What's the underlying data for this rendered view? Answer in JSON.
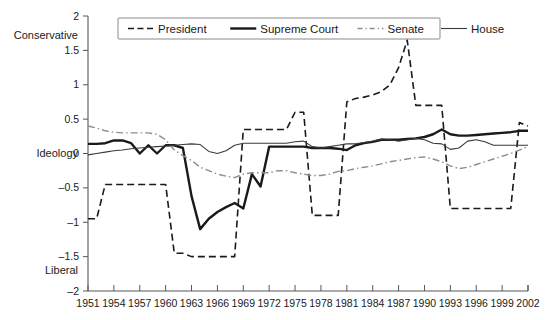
{
  "chart_data": {
    "type": "line",
    "title": "",
    "subtitle": "",
    "xlabel": "",
    "ylabel": "Ideology",
    "xlim": [
      1951,
      2002
    ],
    "ylim": [
      -2,
      2
    ],
    "grid": false,
    "legend_position": "top-inside",
    "y_axis_top_annotation": "Conservative",
    "y_axis_mid_annotation": "Ideology",
    "y_axis_bottom_annotation": "Liberal",
    "yticks": [
      2,
      1.5,
      1,
      0.5,
      0,
      -0.5,
      -1,
      -1.5,
      -2
    ],
    "ytick_labels": [
      "2",
      "1.5",
      "1",
      "0.5",
      "0",
      "-0.5",
      "-1",
      "-1.5",
      "-2"
    ],
    "xticks": [
      1951,
      1954,
      1957,
      1960,
      1963,
      1966,
      1969,
      1972,
      1975,
      1978,
      1981,
      1984,
      1987,
      1990,
      1993,
      1996,
      1999,
      2002
    ],
    "xtick_labels": [
      "1951",
      "1954",
      "1957",
      "1960",
      "1963",
      "1966",
      "1969",
      "1972",
      "1975",
      "1978",
      "1981",
      "1984",
      "1987",
      "1990",
      "1993",
      "1996",
      "1999",
      "2002"
    ],
    "x": [
      1951,
      1952,
      1953,
      1954,
      1955,
      1956,
      1957,
      1958,
      1959,
      1960,
      1961,
      1962,
      1963,
      1964,
      1965,
      1966,
      1967,
      1968,
      1969,
      1970,
      1971,
      1972,
      1973,
      1974,
      1975,
      1976,
      1977,
      1978,
      1979,
      1980,
      1981,
      1982,
      1983,
      1984,
      1985,
      1986,
      1987,
      1988,
      1989,
      1990,
      1991,
      1992,
      1993,
      1994,
      1995,
      1996,
      1997,
      1998,
      1999,
      2000,
      2001,
      2002
    ],
    "series": [
      {
        "name": "President",
        "style": "dashed",
        "color": "#1a1a1a",
        "width": 1.6,
        "values": [
          -0.95,
          -0.95,
          -0.45,
          -0.45,
          -0.45,
          -0.45,
          -0.45,
          -0.45,
          -0.45,
          -0.45,
          -1.45,
          -1.45,
          -1.5,
          -1.5,
          -1.5,
          -1.5,
          -1.5,
          -1.5,
          0.35,
          0.35,
          0.35,
          0.35,
          0.35,
          0.35,
          0.6,
          0.6,
          -0.9,
          -0.9,
          -0.9,
          -0.9,
          0.75,
          0.8,
          0.82,
          0.85,
          0.9,
          1.0,
          1.25,
          1.65,
          0.7,
          0.7,
          0.7,
          0.7,
          -0.8,
          -0.8,
          -0.8,
          -0.8,
          -0.8,
          -0.8,
          -0.8,
          -0.8,
          0.45,
          0.4
        ]
      },
      {
        "name": "Supreme Court",
        "style": "solid",
        "color": "#1a1a1a",
        "width": 2.4,
        "values": [
          0.14,
          0.14,
          0.15,
          0.19,
          0.19,
          0.15,
          0.0,
          0.12,
          0.0,
          0.12,
          0.12,
          0.08,
          -0.62,
          -1.1,
          -0.95,
          -0.85,
          -0.78,
          -0.72,
          -0.8,
          -0.3,
          -0.48,
          0.1,
          0.1,
          0.1,
          0.1,
          0.1,
          0.08,
          0.08,
          0.08,
          0.07,
          0.05,
          0.12,
          0.15,
          0.17,
          0.2,
          0.2,
          0.2,
          0.21,
          0.22,
          0.24,
          0.28,
          0.35,
          0.28,
          0.26,
          0.26,
          0.27,
          0.28,
          0.29,
          0.3,
          0.31,
          0.33,
          0.33
        ]
      },
      {
        "name": "Senate",
        "style": "dashdot",
        "color": "#8d8d8f",
        "width": 1.4,
        "values": [
          0.4,
          0.37,
          0.33,
          0.31,
          0.3,
          0.3,
          0.3,
          0.3,
          0.28,
          0.2,
          0.05,
          -0.03,
          -0.1,
          -0.2,
          -0.25,
          -0.3,
          -0.33,
          -0.35,
          -0.3,
          -0.28,
          -0.28,
          -0.28,
          -0.25,
          -0.25,
          -0.28,
          -0.3,
          -0.32,
          -0.32,
          -0.3,
          -0.26,
          -0.25,
          -0.22,
          -0.2,
          -0.18,
          -0.15,
          -0.12,
          -0.1,
          -0.08,
          -0.06,
          -0.05,
          -0.08,
          -0.12,
          -0.18,
          -0.22,
          -0.2,
          -0.16,
          -0.12,
          -0.08,
          -0.04,
          0.0,
          0.05,
          0.1
        ]
      },
      {
        "name": "House",
        "style": "solid-thin",
        "color": "#3a3a3c",
        "width": 1.1,
        "values": [
          -0.02,
          0.0,
          0.02,
          0.04,
          0.05,
          0.07,
          0.08,
          0.09,
          0.1,
          0.11,
          0.12,
          0.13,
          0.14,
          0.13,
          0.03,
          0.0,
          0.04,
          0.12,
          0.15,
          0.15,
          0.15,
          0.15,
          0.15,
          0.15,
          0.17,
          0.18,
          0.1,
          0.08,
          0.1,
          0.12,
          0.14,
          0.14,
          0.16,
          0.18,
          0.21,
          0.2,
          0.18,
          0.2,
          0.22,
          0.2,
          0.15,
          0.14,
          0.06,
          0.08,
          0.18,
          0.2,
          0.17,
          0.12,
          0.12,
          0.12,
          0.12,
          0.12
        ]
      }
    ]
  },
  "legend": {
    "entries": [
      {
        "label": "President",
        "style": "dashed"
      },
      {
        "label": "Supreme Court",
        "style": "solid"
      },
      {
        "label": "Senate",
        "style": "dashdot"
      },
      {
        "label": "House",
        "style": "solid-thin"
      }
    ]
  }
}
